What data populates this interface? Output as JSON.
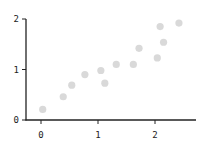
{
  "chart_data": {
    "type": "scatter",
    "title": "",
    "xlabel": "",
    "ylabel": "",
    "xlim": [
      -0.27,
      2.72
    ],
    "ylim": [
      0,
      2
    ],
    "xticks": [
      0,
      1,
      2
    ],
    "yticks": [
      0,
      1,
      2
    ],
    "xtick_labels": [
      "0",
      "1",
      "2"
    ],
    "ytick_labels": [
      "0",
      "1",
      "2"
    ],
    "grid": false,
    "legend": null,
    "marker_color": "#d9d9d9",
    "points": [
      {
        "x": 0.03,
        "y": 0.21
      },
      {
        "x": 0.39,
        "y": 0.46
      },
      {
        "x": 0.54,
        "y": 0.69
      },
      {
        "x": 0.77,
        "y": 0.9
      },
      {
        "x": 1.05,
        "y": 0.98
      },
      {
        "x": 1.12,
        "y": 0.73
      },
      {
        "x": 1.32,
        "y": 1.1
      },
      {
        "x": 1.62,
        "y": 1.1
      },
      {
        "x": 1.72,
        "y": 1.42
      },
      {
        "x": 2.04,
        "y": 1.23
      },
      {
        "x": 2.09,
        "y": 1.85
      },
      {
        "x": 2.15,
        "y": 1.54
      },
      {
        "x": 2.42,
        "y": 1.92
      }
    ]
  }
}
